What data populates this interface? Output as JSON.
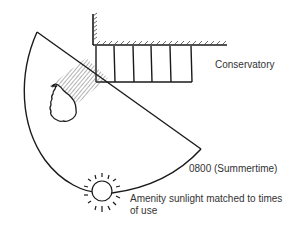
{
  "diagram": {
    "labels": {
      "conservatory": "Conservatory",
      "time": "0800 (Summertime)",
      "amenity": "Amenity sunlight matched to times of use"
    },
    "elements": {
      "building_wall": "hatched-wall",
      "conservatory_bays": 5,
      "tree": "tree-canopy",
      "shadow": "tree-shadow-hatching",
      "sun": "sun-icon",
      "sun_path_sector": "sunlight-sector"
    },
    "colors": {
      "ink": "#1a1a1a",
      "text": "#333333",
      "background": "#ffffff"
    }
  }
}
